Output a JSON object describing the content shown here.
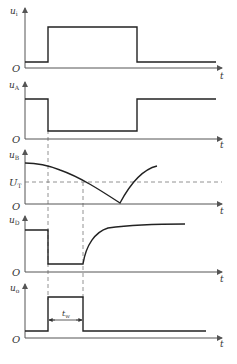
{
  "diagram": {
    "type": "timing waveform diagram (monostable / one-shot)",
    "time_axis_label": "t",
    "origin_label": "O",
    "panels": [
      {
        "id": "ui",
        "signal": "u",
        "subscript": "i",
        "description": "input pulse: low, rises at t1, falls at t2"
      },
      {
        "id": "uA",
        "signal": "u",
        "subscript": "A",
        "description": "inverted: high, drops at t1, rises at t2"
      },
      {
        "id": "uB",
        "signal": "u",
        "subscript": "B",
        "description": "decays from high past U_T to 0, then recovers upward",
        "threshold_label": {
          "signal": "U",
          "subscript": "T"
        }
      },
      {
        "id": "uD",
        "signal": "u",
        "subscript": "D",
        "description": "high, drops at t1, recovers exponentially at t3 (when u_B crosses U_T)"
      },
      {
        "id": "uo",
        "signal": "u",
        "subscript": "o",
        "description": "output pulse high between t1 and t3",
        "pulse_width_label": {
          "signal": "t",
          "subscript": "w"
        }
      }
    ]
  },
  "labels": {
    "t": "t",
    "O": "O",
    "u": "u",
    "U": "U",
    "ui_sub": "i",
    "uA_sub": "A",
    "uB_sub": "B",
    "UT_sub": "T",
    "uD_sub": "D",
    "uo_sub": "o",
    "tw_main": "t",
    "tw_sub": "w"
  }
}
